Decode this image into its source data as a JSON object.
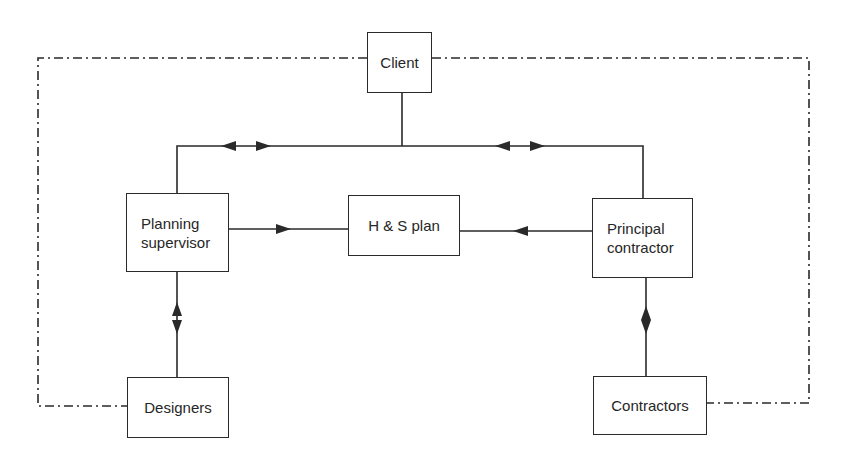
{
  "diagram": {
    "type": "organisation-flow",
    "nodes": {
      "client": {
        "label": "Client"
      },
      "planning_supervisor": {
        "line1": "Planning",
        "line2": "supervisor"
      },
      "hs_plan": {
        "label": "H & S plan"
      },
      "principal_contractor": {
        "line1": "Principal",
        "line2": "contractor"
      },
      "designers": {
        "label": "Designers"
      },
      "contractors": {
        "label": "Contractors"
      }
    },
    "edges": [
      {
        "from": "client",
        "to": "planning_supervisor",
        "style": "solid",
        "arrows": "bidirectional"
      },
      {
        "from": "client",
        "to": "principal_contractor",
        "style": "solid",
        "arrows": "bidirectional"
      },
      {
        "from": "planning_supervisor",
        "to": "hs_plan",
        "style": "solid",
        "arrows": "forward"
      },
      {
        "from": "principal_contractor",
        "to": "hs_plan",
        "style": "solid",
        "arrows": "forward"
      },
      {
        "from": "planning_supervisor",
        "to": "designers",
        "style": "solid",
        "arrows": "bidirectional"
      },
      {
        "from": "principal_contractor",
        "to": "contractors",
        "style": "solid",
        "arrows": "bidirectional"
      },
      {
        "from": "client",
        "to": "designers",
        "style": "dash-dot",
        "arrows": "none"
      },
      {
        "from": "client",
        "to": "contractors",
        "style": "dash-dot",
        "arrows": "none"
      }
    ],
    "colors": {
      "line": "#2a2a2a",
      "background": "#ffffff"
    }
  }
}
